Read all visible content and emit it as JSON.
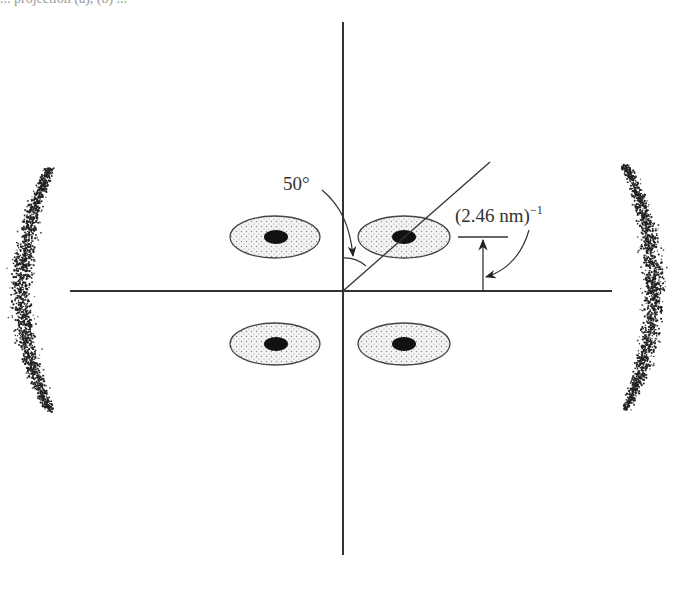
{
  "top_text_fragment": "... projection (a), (b) ...",
  "chart_data": {
    "type": "diagram",
    "title": "",
    "axes": {
      "horizontal": {
        "x1": 70,
        "x2": 612,
        "y": 291
      },
      "vertical": {
        "x": 343,
        "y1": 22,
        "y2": 555
      }
    },
    "tilt_line": {
      "from": [
        343,
        291
      ],
      "to": [
        490,
        162
      ],
      "angle_from_vertical_deg": 50
    },
    "reflections": [
      {
        "cx": 275,
        "cy": 237,
        "rx": 45,
        "ry": 21,
        "core_rx": 12,
        "core_ry": 7
      },
      {
        "cx": 404,
        "cy": 237,
        "rx": 46,
        "ry": 21,
        "core_rx": 12,
        "core_ry": 7
      },
      {
        "cx": 275,
        "cy": 344,
        "rx": 45,
        "ry": 21,
        "core_rx": 12,
        "core_ry": 7
      },
      {
        "cx": 404,
        "cy": 344,
        "rx": 46,
        "ry": 21,
        "core_rx": 12,
        "core_ry": 7
      }
    ],
    "equatorial_arcs": [
      {
        "side": "left",
        "x_center": 38,
        "y_top": 168,
        "y_bottom": 412
      },
      {
        "side": "right",
        "x_center": 638,
        "y_top": 165,
        "y_bottom": 410
      }
    ],
    "annotations": [
      {
        "text": "50°",
        "x": 283,
        "y": 190
      },
      {
        "text": "(2.46 nm)",
        "superscript": "−1",
        "x": 455,
        "y": 222
      }
    ]
  },
  "labels": {
    "angle": "50°",
    "spacing_base": "(2.46 nm)",
    "spacing_exp": "−1"
  }
}
